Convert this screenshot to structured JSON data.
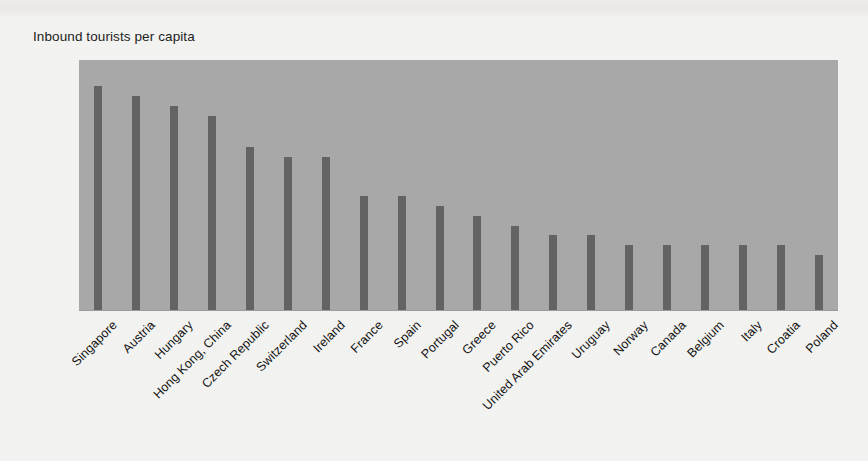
{
  "chart_data": {
    "type": "bar",
    "title": "Inbound tourists per capita",
    "xlabel": "",
    "ylabel": "Inbound tourists per capita",
    "ylim": [
      0,
      2.5
    ],
    "yticks": [
      "0",
      "0.5",
      "1.0",
      "1.5",
      "2.0",
      "2.5"
    ],
    "ytick_values": [
      0,
      0.5,
      1.0,
      1.5,
      2.0,
      2.5
    ],
    "grid": false,
    "legend": false,
    "orientation": "vertical",
    "bar_color": "#636363",
    "plot_background": "#a8a8a8",
    "figure_background": "#f2f2f0",
    "categories": [
      "Singapore",
      "Austria",
      "Hungary",
      "Hong Kong, China",
      "Czech Republic",
      "Switzerland",
      "Ireland",
      "France",
      "Spain",
      "Portugal",
      "Greece",
      "Puerto Rico",
      "United Arab Emirates",
      "Uruguay",
      "Norway",
      "Canada",
      "Belgium",
      "Italy",
      "Croatia",
      "Poland"
    ],
    "values": [
      2.24,
      2.14,
      2.04,
      1.94,
      1.63,
      1.53,
      1.53,
      1.14,
      1.14,
      1.04,
      0.94,
      0.84,
      0.75,
      0.75,
      0.65,
      0.65,
      0.65,
      0.65,
      0.65,
      0.55
    ]
  }
}
